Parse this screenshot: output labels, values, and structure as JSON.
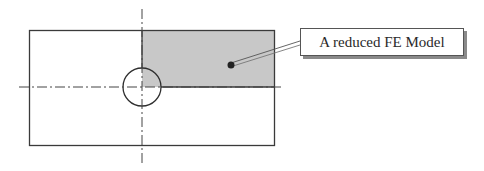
{
  "diagram": {
    "type": "engineering-drawing",
    "label": {
      "text": "A reduced FE Model"
    },
    "colors": {
      "outline": "#3a3a3a",
      "shaded_region": "#c8c8c8",
      "centerline": "#444444",
      "pointer_dot": "#222222"
    },
    "elements": [
      {
        "id": "plate",
        "shape": "rectangle"
      },
      {
        "id": "hole",
        "shape": "circle"
      },
      {
        "id": "quarter-region",
        "shape": "rectangle",
        "fill": "shaded"
      },
      {
        "id": "vertical-centerline",
        "style": "dash-dot"
      },
      {
        "id": "horizontal-centerline",
        "style": "dash-dot"
      },
      {
        "id": "leader",
        "from": "quarter-region",
        "to": "label"
      }
    ]
  }
}
